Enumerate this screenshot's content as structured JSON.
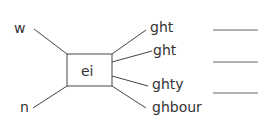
{
  "diagram": {
    "center": "ei",
    "left_words": [
      "w",
      "n"
    ],
    "right_words": [
      "ght",
      "ght",
      "ghty",
      "ghbour"
    ],
    "answer_blanks": 3,
    "line_color": "#444444"
  }
}
